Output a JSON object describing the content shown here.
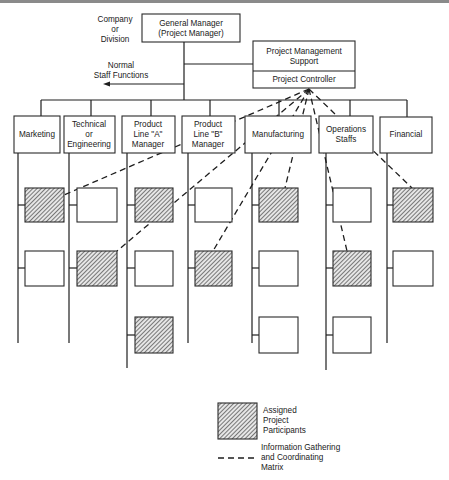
{
  "diagram": {
    "title_note": [
      "Company",
      "or",
      "Division"
    ],
    "general_manager": [
      "General Manager",
      "(Project Manager)"
    ],
    "pm_support": [
      "Project Management",
      "Support"
    ],
    "project_controller": "Project Controller",
    "staff_functions": [
      "Normal",
      "Staff Functions"
    ],
    "departments": [
      {
        "label": [
          "Marketing"
        ],
        "participants": [
          "assigned",
          "unassigned"
        ]
      },
      {
        "label": [
          "Technical",
          "or",
          "Engineering"
        ],
        "participants": [
          "unassigned",
          "assigned"
        ]
      },
      {
        "label": [
          "Product",
          "Line \"A\"",
          "Manager"
        ],
        "participants": [
          "assigned",
          "unassigned",
          "assigned"
        ]
      },
      {
        "label": [
          "Product",
          "Line \"B\"",
          "Manager"
        ],
        "participants": [
          "unassigned",
          "assigned"
        ]
      },
      {
        "label": [
          "Manufacturing"
        ],
        "participants": [
          "assigned",
          "unassigned",
          "unassigned"
        ]
      },
      {
        "label": [
          "Operations",
          "Staffs"
        ],
        "participants": [
          "unassigned",
          "assigned",
          "unassigned"
        ]
      },
      {
        "label": [
          "Financial"
        ],
        "participants": [
          "assigned",
          "unassigned"
        ]
      }
    ],
    "coordination_links": [
      {
        "from": "Project Controller",
        "to": "Marketing row 1"
      },
      {
        "from": "Project Controller",
        "to": "Technical or Engineering row 2"
      },
      {
        "from": "Project Controller",
        "to": "Product Line B row 2"
      },
      {
        "from": "Project Controller",
        "to": "Manufacturing row 1"
      },
      {
        "from": "Project Controller",
        "to": "Operations Staffs row 2"
      },
      {
        "from": "Project Controller",
        "to": "Financial row 1"
      }
    ]
  },
  "legend": {
    "assigned": [
      "Assigned",
      "Project",
      "Participants"
    ],
    "matrix": [
      "Information Gathering",
      "and Coordinating",
      "Matrix"
    ]
  }
}
